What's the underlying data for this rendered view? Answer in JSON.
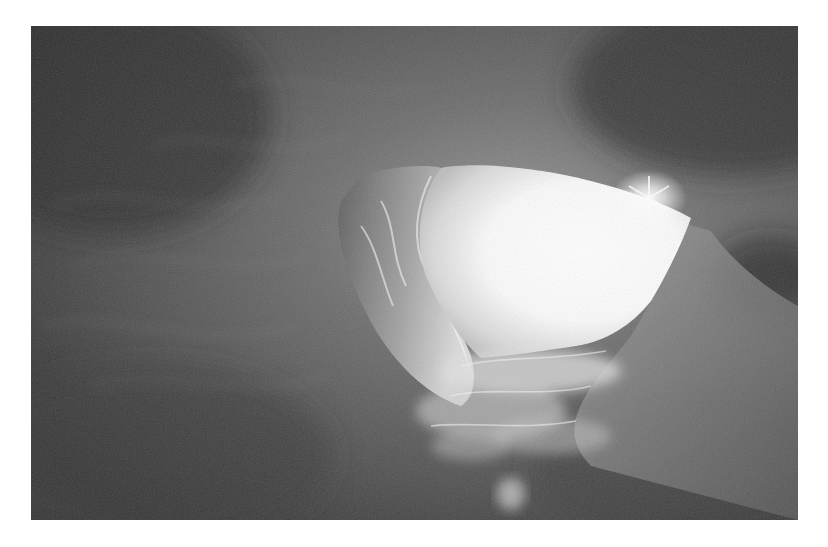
{
  "image": {
    "subject": "ice cave interior looking up toward a bright opening",
    "style": "black-and-white photograph",
    "elements": [
      "dark textured snow/ice ceiling",
      "bright irregular opening to the sky",
      "sun flare at upper-right rim of opening",
      "sculpted sunlit ice wall on left side of opening",
      "light-scattered ice fragments below opening",
      "small bright ice patch near bottom center"
    ]
  },
  "colors": {
    "background": "#ffffff",
    "cave_dark": "#3a3a3a",
    "cave_mid": "#6a6a6a",
    "opening_light": "#ffffff",
    "lit_ice": "#d8d8d8"
  }
}
